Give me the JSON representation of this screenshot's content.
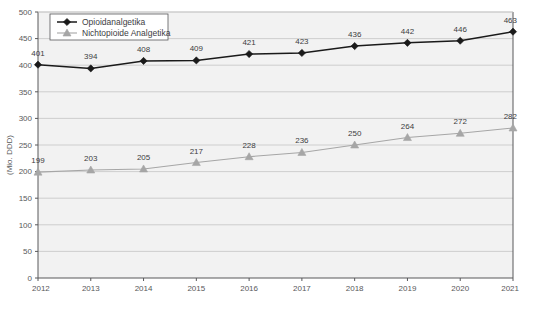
{
  "chart_data": {
    "type": "line",
    "title": "",
    "subtitle": "",
    "xlabel": "",
    "ylabel": "(Mio. DDD)",
    "categories": [
      "2012",
      "2013",
      "2014",
      "2015",
      "2016",
      "2017",
      "2018",
      "2019",
      "2020",
      "2021"
    ],
    "x": [
      2012,
      2013,
      2014,
      2015,
      2016,
      2017,
      2018,
      2019,
      2020,
      2021
    ],
    "ylim": [
      0,
      500
    ],
    "yticks": [
      0,
      50,
      100,
      150,
      200,
      250,
      300,
      350,
      400,
      450,
      500
    ],
    "ytick_labels": [
      "0",
      "50",
      "100",
      "150",
      "200",
      "250",
      "300",
      "350",
      "400",
      "450",
      "500"
    ],
    "grid": true,
    "legend_position": "top-left",
    "series": [
      {
        "name": "Opioidanalgetika",
        "marker": "diamond",
        "color": "#1a1a1a",
        "values": [
          401,
          394,
          408,
          409,
          421,
          423,
          436,
          442,
          446,
          463
        ],
        "labels": [
          "401",
          "394",
          "408",
          "409",
          "421",
          "423",
          "436",
          "442",
          "446",
          "463"
        ]
      },
      {
        "name": "Nichtopioide Analgetika",
        "marker": "triangle",
        "color": "#a6a6a6",
        "values": [
          199,
          203,
          205,
          217,
          228,
          236,
          250,
          264,
          272,
          282
        ],
        "labels": [
          "199",
          "203",
          "205",
          "217",
          "228",
          "236",
          "250",
          "264",
          "272",
          "282"
        ]
      }
    ]
  },
  "legend": {
    "items": [
      {
        "label": "Opioidanalgetika",
        "marker": "diamond-marker-icon"
      },
      {
        "label": "Nichtopioide Analgetika",
        "marker": "triangle-marker-icon"
      }
    ]
  },
  "colors": {
    "series_opioid": "#1a1a1a",
    "series_nonopioid": "#a6a6a6",
    "plot_background": "#f2f2f2",
    "gridline": "#c9c9c9",
    "axis": "#58585a",
    "text": "#58585a",
    "legend_background": "#ffffff",
    "legend_border": "#58585a"
  }
}
